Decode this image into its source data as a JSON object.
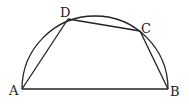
{
  "diagram": {
    "points": {
      "A": {
        "label": "A",
        "x": 22,
        "y": 89
      },
      "B": {
        "label": "B",
        "x": 168,
        "y": 89
      },
      "C": {
        "label": "C",
        "x": 140,
        "y": 31
      },
      "D": {
        "label": "D",
        "x": 68,
        "y": 19
      }
    },
    "segments": [
      "AB",
      "BC",
      "CD",
      "DA"
    ],
    "arc": {
      "type": "semicircle",
      "diameter": "AB",
      "center_x": 95,
      "center_y": 89,
      "radius": 73
    },
    "colors": {
      "stroke": "#222222",
      "background": "#ffffff"
    }
  }
}
